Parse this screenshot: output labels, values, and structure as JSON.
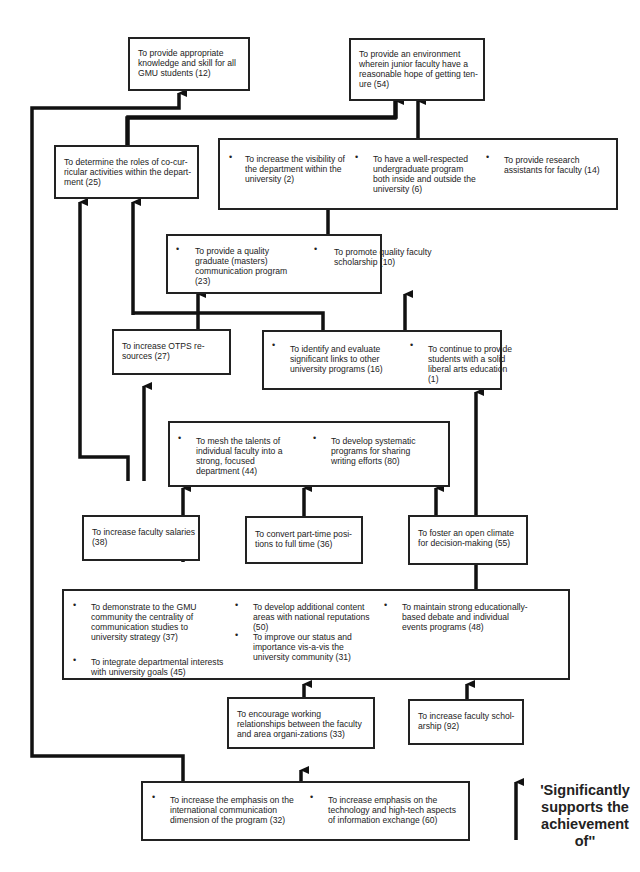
{
  "diagram": {
    "goals": {
      "g12": "To provide appropriate knowledge and skill for all GMU students (12)",
      "g54": "To provide an environment wherein junior faculty have a reasonable hope of getting ten-ure (54)",
      "g25": "To determine the roles of co-cur-ricular activities within the depart-ment (25)",
      "g2": "To increase the visibility of the department within the university (2)",
      "g6": "To have a well-respected undergraduate program both inside and outside the university (6)",
      "g14": "To provide research assistants for faculty (14)",
      "g23": "To provide a quality graduate (masters) communication program (23)",
      "g10": "To promote quality faculty scholarship (10)",
      "g27": "To increase OTPS re-sources (27)",
      "g16": "To identify and evaluate significant links to other university programs (16)",
      "g1": "To continue to provide students with a solid liberal arts education (1)",
      "g44": "To mesh the talents of individual faculty into a strong, focused department (44)",
      "g80": "To develop systematic programs for sharing writing efforts (80)",
      "g38": "To increase faculty salaries (38)",
      "g36": "To convert part-time posi-tions to full time (36)",
      "g55": "To foster an open climate for decision-making (55)",
      "g37": "To demonstrate to the GMU community the centrality of communication studies to university strategy (37)",
      "g45": "To integrate departmental interests with university goals (45)",
      "g50": "To develop additional content areas with national reputations (50)",
      "g31": "To improve our status and importance vis-a-vis the university community (31)",
      "g48": "To maintain strong educationally-based debate and individual events programs (48)",
      "g33": "To encourage working relationships between the faculty and area organi-zations (33)",
      "g92": "To increase faculty schol-arship (92)",
      "g32": "To increase the emphasis on the international communication dimension of the program (32)",
      "g60": "To increase emphasis on the technology and high-tech aspects of information exchange (60)"
    },
    "bullet": "•",
    "legend": {
      "text": "'Significantly supports the achievement of''",
      "icon": "up-arrow"
    },
    "colors": {
      "line": "#111111",
      "box_border": "#222222",
      "background": "#ffffff"
    }
  }
}
